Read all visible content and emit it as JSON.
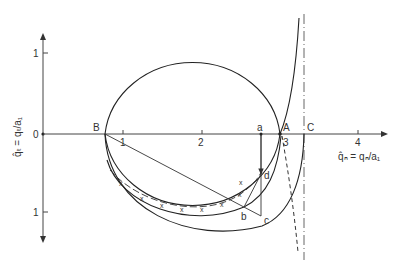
{
  "diagram": {
    "y_axis": {
      "label": "q̂ₜ = qₜ/a₁",
      "ticks": [
        {
          "label": "1",
          "position": "up"
        },
        {
          "label": "0",
          "position": "origin"
        },
        {
          "label": "1",
          "position": "down"
        }
      ]
    },
    "x_axis": {
      "label": "q̂ₙ = qₙ/a₁",
      "ticks": [
        "1",
        "2",
        "3",
        "4"
      ]
    },
    "points": {
      "B": "B",
      "a": "a",
      "A": "A",
      "C": "C",
      "b": "b",
      "c": "c",
      "d": "d"
    },
    "curves": [
      {
        "name": "circle",
        "style": "solid"
      },
      {
        "name": "marked-curve",
        "style": "dash-x",
        "marker": "x"
      },
      {
        "name": "inner-arc",
        "style": "solid"
      },
      {
        "name": "outer-arc",
        "style": "solid"
      },
      {
        "name": "rising-branch",
        "style": "solid"
      },
      {
        "name": "descending-branch",
        "style": "dashed"
      },
      {
        "name": "asymptote-C",
        "style": "dash-dot"
      }
    ],
    "colors": {
      "line": "#222222",
      "background": "#ffffff"
    }
  }
}
